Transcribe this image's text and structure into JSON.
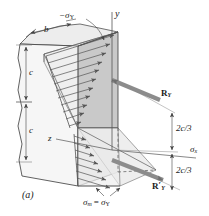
{
  "figure": {
    "caption": "(a)",
    "axes": {
      "y_axis_label": "y",
      "z_axis_label": "z",
      "x_axis_label": "σ",
      "x_axis_sub": "x"
    },
    "dimensions": [
      {
        "id": "width-b",
        "label": "b"
      },
      {
        "id": "upper-depth-c",
        "label": "c"
      },
      {
        "id": "lower-depth-c",
        "label": "c"
      },
      {
        "id": "upper-centroid",
        "label": "2c/3"
      },
      {
        "id": "lower-centroid",
        "label": "2c/3"
      }
    ],
    "stress_labels": {
      "compressive_top": "−σ",
      "compressive_top_sub": "Y",
      "max_bottom_lhs": "σ",
      "max_bottom_lhs_sub": "m",
      "max_bottom_eq": "=",
      "max_bottom_rhs": "σ",
      "max_bottom_rhs_sub": "Y"
    },
    "resultants": [
      {
        "id": "resultant-upper",
        "label": "R",
        "sub": "Y",
        "prime": ""
      },
      {
        "id": "resultant-lower",
        "label": "R",
        "sub": "Y",
        "prime": "′"
      }
    ],
    "colors": {
      "ink": "#1a1a1a",
      "line": "#3a3a3a",
      "thin_line": "#707070",
      "face_front": "#c9c9c9",
      "face_top": "#ebebeb",
      "face_side": "#d8d8d8",
      "wedge_fill": "#e2e2e2",
      "wedge_fill_light": "#ededed",
      "arrow_body": "#8c8c8c",
      "arrow_dark": "#6e6e6e",
      "hatch": "#555555",
      "background": "#ffffff"
    }
  }
}
